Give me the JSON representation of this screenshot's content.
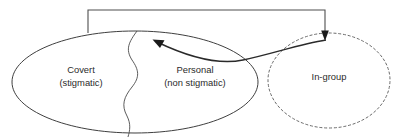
{
  "diagram": {
    "background_color": "#ffffff",
    "line_color": "#3f3f3f",
    "dashed_line_color": "#6b6b6b",
    "arrow_color": "#1a1a1a",
    "text_color": "#2b2b2b",
    "nodes": [
      {
        "id": "self-ellipse",
        "name": "self-ellipse",
        "shape": "ellipse",
        "border": "solid",
        "segments": [
          {
            "id": "covert-segment",
            "label_line1": "Covert",
            "label_line2": "(stigmatic)"
          },
          {
            "id": "personal-segment",
            "label_line1": "Personal",
            "label_line2": "(non stigmatic)"
          }
        ]
      },
      {
        "id": "ingroup-circle",
        "name": "ingroup-circle",
        "shape": "circle",
        "border": "dashed",
        "label_line1": "In-group",
        "label_line2": ""
      }
    ],
    "connectors": [
      {
        "id": "bracket-connector",
        "name": "bracket-connector",
        "style": "square-bracket",
        "from": "self-ellipse",
        "to": "ingroup-circle",
        "arrowhead": "down",
        "label": ""
      },
      {
        "id": "curved-connector",
        "name": "curved-connector",
        "style": "curve",
        "from": "ingroup-circle",
        "to": "personal-segment",
        "arrowhead": "up-left",
        "label": ""
      }
    ]
  }
}
